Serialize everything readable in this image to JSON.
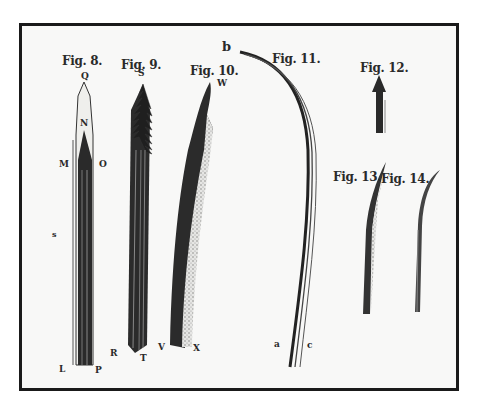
{
  "plate": {
    "figures": [
      {
        "id": "fig8",
        "title": "Fig. 8.",
        "points": [
          "Q",
          "N",
          "M",
          "O",
          "L",
          "P"
        ]
      },
      {
        "id": "fig9",
        "title": "Fig. 9.",
        "points": [
          "S",
          "R",
          "T"
        ]
      },
      {
        "id": "fig10",
        "title": "Fig. 10.",
        "points": [
          "W",
          "V",
          "X"
        ]
      },
      {
        "id": "fig11",
        "title": "Fig. 11.",
        "points": [
          "b",
          "a",
          "c"
        ]
      },
      {
        "id": "fig12",
        "title": "Fig. 12.",
        "points": []
      },
      {
        "id": "fig13",
        "title": "Fig. 13.",
        "points": []
      },
      {
        "id": "fig14",
        "title": "Fig. 14.",
        "points": []
      }
    ],
    "stray_mark": "s",
    "colors": {
      "ink": "#222222",
      "paper": "#f8f8f7",
      "frame": "#1a1a1a"
    }
  }
}
